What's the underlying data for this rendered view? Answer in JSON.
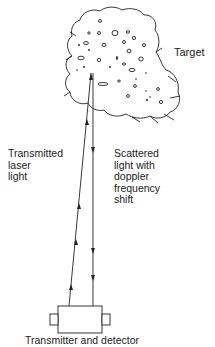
{
  "diagram": {
    "labels": {
      "target": "Target",
      "transmitted": [
        "Transmitted",
        "laser",
        "light"
      ],
      "scattered": [
        "Scattered",
        "light with",
        "doppler",
        "frequency",
        "shift"
      ],
      "device": "Transmitter and detector"
    },
    "nodes": [
      {
        "id": "target",
        "shape": "cloud",
        "label": "Target"
      },
      {
        "id": "device",
        "shape": "box-with-side-tabs",
        "label": "Transmitter and detector"
      }
    ],
    "edges": [
      {
        "from": "device",
        "to": "target",
        "label": "Transmitted laser light",
        "arrows": 3
      },
      {
        "from": "target",
        "to": "device",
        "label": "Scattered light with doppler frequency shift",
        "arrows": 3
      }
    ],
    "colors": {
      "line": "#222222",
      "background": "#ffffff"
    }
  }
}
